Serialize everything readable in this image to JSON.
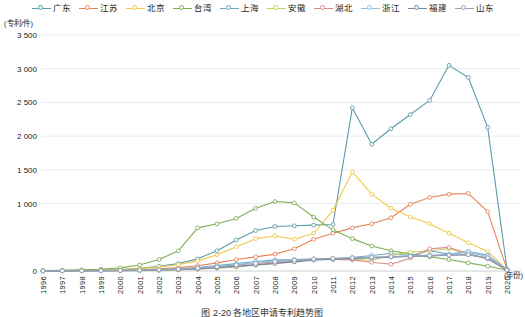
{
  "chart_data": {
    "type": "line",
    "title": "",
    "xlabel": "(年份)",
    "ylabel": "(专利/件)",
    "y_unit": "(专利/件)",
    "x_unit": "(年份)",
    "grid": true,
    "legend_position": "top",
    "ylim": [
      0,
      3500
    ],
    "yticks": [
      0,
      1000,
      1500,
      2000,
      2500,
      3000,
      3500
    ],
    "ytick_labels": [
      "0",
      "1 000",
      "",
      "2 000",
      "2 500",
      "3 000",
      "3 500"
    ],
    "ytick_labels_shown": [
      "3 500",
      "3 000",
      "2 500",
      "2 000",
      "1 500",
      "1 000",
      "0"
    ],
    "categories": [
      1996,
      1997,
      1998,
      1999,
      2000,
      2001,
      2002,
      2003,
      2004,
      2005,
      2006,
      2007,
      2008,
      2009,
      2010,
      2011,
      2012,
      2013,
      2014,
      2015,
      2016,
      2017,
      2018,
      2019,
      2020
    ],
    "series": [
      {
        "name": "广东",
        "color": "#5b9bab",
        "values": [
          5,
          8,
          10,
          14,
          22,
          40,
          70,
          110,
          180,
          300,
          460,
          600,
          660,
          670,
          680,
          690,
          2420,
          1880,
          2110,
          2320,
          2530,
          3050,
          2870,
          2130,
          30
        ]
      },
      {
        "name": "江苏",
        "color": "#e8835a",
        "values": [
          3,
          4,
          6,
          8,
          12,
          20,
          32,
          50,
          78,
          120,
          170,
          210,
          250,
          330,
          470,
          560,
          640,
          700,
          790,
          990,
          1090,
          1140,
          1150,
          880,
          25
        ]
      },
      {
        "name": "北京",
        "color": "#f0c84a",
        "values": [
          4,
          6,
          9,
          13,
          20,
          35,
          60,
          95,
          150,
          240,
          360,
          480,
          520,
          470,
          560,
          900,
          1470,
          1140,
          930,
          800,
          700,
          560,
          420,
          290,
          20
        ]
      },
      {
        "name": "台湾",
        "color": "#7fae54",
        "values": [
          6,
          10,
          16,
          26,
          46,
          90,
          170,
          300,
          640,
          700,
          780,
          930,
          1030,
          1010,
          800,
          610,
          480,
          370,
          300,
          250,
          210,
          170,
          120,
          70,
          15
        ]
      },
      {
        "name": "上海",
        "color": "#6fa8c9",
        "values": [
          2,
          3,
          4,
          6,
          9,
          14,
          22,
          34,
          52,
          80,
          110,
          140,
          165,
          170,
          175,
          180,
          200,
          230,
          260,
          230,
          300,
          250,
          290,
          235,
          18
        ]
      },
      {
        "name": "安徽",
        "color": "#c8cf5f",
        "values": [
          1,
          1,
          2,
          3,
          4,
          6,
          10,
          16,
          25,
          40,
          60,
          85,
          110,
          140,
          175,
          190,
          175,
          160,
          230,
          280,
          300,
          330,
          250,
          190,
          12
        ]
      },
      {
        "name": "湖北",
        "color": "#d98a8a",
        "values": [
          1,
          2,
          3,
          4,
          6,
          9,
          14,
          22,
          34,
          50,
          70,
          95,
          120,
          150,
          175,
          170,
          165,
          130,
          100,
          190,
          330,
          350,
          260,
          180,
          10
        ]
      },
      {
        "name": "浙江",
        "color": "#8fc4de",
        "values": [
          2,
          3,
          4,
          6,
          9,
          13,
          20,
          30,
          45,
          68,
          95,
          125,
          150,
          170,
          180,
          185,
          195,
          205,
          215,
          225,
          235,
          245,
          280,
          210,
          14
        ]
      },
      {
        "name": "福建",
        "color": "#6f8aa8",
        "values": [
          1,
          2,
          3,
          4,
          6,
          9,
          14,
          21,
          32,
          48,
          68,
          90,
          112,
          135,
          160,
          175,
          185,
          195,
          205,
          215,
          225,
          235,
          240,
          185,
          10
        ]
      },
      {
        "name": "山东",
        "color": "#9aa3b5",
        "values": [
          2,
          3,
          4,
          5,
          8,
          12,
          18,
          28,
          42,
          62,
          88,
          112,
          138,
          160,
          178,
          188,
          196,
          204,
          212,
          220,
          228,
          236,
          242,
          196,
          11
        ]
      }
    ]
  },
  "legend": {
    "items": [
      {
        "label": "广东",
        "color": "#5b9bab"
      },
      {
        "label": "江苏",
        "color": "#e8835a"
      },
      {
        "label": "北京",
        "color": "#f0c84a"
      },
      {
        "label": "台湾",
        "color": "#7fae54"
      },
      {
        "label": "上海",
        "color": "#6fa8c9"
      },
      {
        "label": "安徽",
        "color": "#c8cf5f"
      },
      {
        "label": "湖北",
        "color": "#d98a8a"
      },
      {
        "label": "浙江",
        "color": "#8fc4de"
      },
      {
        "label": "福建",
        "color": "#6f8aa8"
      },
      {
        "label": "山东",
        "color": "#9aa3b5"
      }
    ]
  },
  "caption": "图 2-20  各地区申请专利趋势图"
}
